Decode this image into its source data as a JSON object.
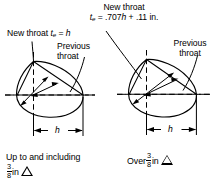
{
  "figure": {
    "title_top": {
      "line1": "New throat",
      "formula_lhs": "t",
      "formula_sub": "e",
      "formula_rhs": " = .707",
      "formula_var": "h",
      "formula_tail": " + .11 in."
    },
    "left_diagram": {
      "throat_label_prefix": "New throat ",
      "throat_label_var": "t",
      "throat_label_sub": "e",
      "throat_label_eq": " = ",
      "throat_label_h": "h",
      "previous_throat_line1": "Previous",
      "previous_throat_line2": "throat",
      "dimension_label": "h",
      "caption_line1": "Up to and including",
      "caption_num": "3",
      "caption_den": "8",
      "caption_unit": "in"
    },
    "right_diagram": {
      "previous_throat_line1": "Previous",
      "previous_throat_line2": "throat",
      "dimension_label": "h",
      "caption_prefix": "Over",
      "caption_num": "3",
      "caption_den": "8",
      "caption_unit": "in"
    },
    "colors": {
      "ink": "#000000",
      "background": "#ffffff"
    }
  }
}
